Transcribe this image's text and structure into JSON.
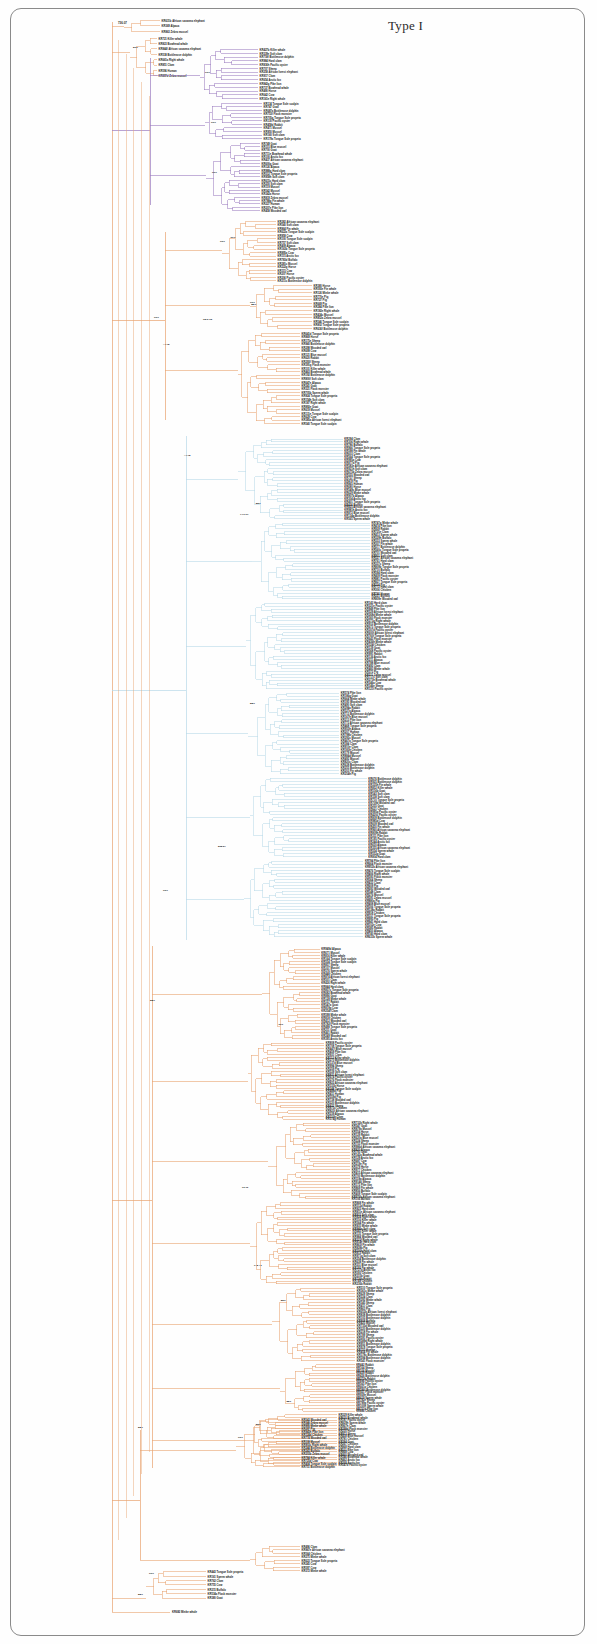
{
  "figure": {
    "title": "Type I",
    "type": "phylogenetic-tree",
    "frame_border_color": "#8a8a8a",
    "background": "#fefefe"
  },
  "clade_colors": {
    "purple": "#9b7cc0",
    "orange": "#e8a36f",
    "lightblue": "#b8d8e8",
    "label_text": "#1a1a1a"
  },
  "chart_data": {
    "type": "tree",
    "title": "Type I",
    "root_support": "736.07",
    "host_species": [
      "Cow",
      "Sheep",
      "Goat",
      "Pig",
      "Buffalo",
      "Horse",
      "Rabbit",
      "Human",
      "Chicken",
      "Pacific oyster",
      "Clam",
      "Mussel",
      "Zebra mussel",
      "Blue mussel",
      "Hard clam",
      "Soft clam",
      "Bottlenose dolphin",
      "Killer whale",
      "Sperm whale",
      "Minke whale",
      "Bowhead whale",
      "Fin whale",
      "Right whale",
      "African savanna elephant",
      "African forest elephant",
      "Tongue Sole scalpin",
      "Tongue Sole propeta",
      "Wooded owl",
      "Pike lion",
      "Flask monster",
      "Bottlenose dolphin",
      "Arctic fox",
      "Alpaca"
    ],
    "accession_prefix": "KR",
    "leaf_count": 484,
    "clades": [
      {
        "name": "Clade A (purple)",
        "color": "#9b7cc0",
        "span_y": [
          16,
          215
        ],
        "leaf_count": 52,
        "support_values": [
          "88/1",
          "99/1",
          "88/1",
          "99/1",
          "99/1",
          "99/1",
          "99/1"
        ]
      },
      {
        "name": "Clade B (orange upper)",
        "color": "#e8a36f",
        "span_y": [
          218,
          430
        ],
        "leaf_count": 58,
        "support_values": [
          "96/1",
          "98.6/.95",
          "99/1",
          "99/1",
          "99/1",
          "99/1"
        ]
      },
      {
        "name": "Clade C (light blue)",
        "color": "#b8d8e8",
        "span_y": [
          432,
          940
        ],
        "leaf_count": 168,
        "support_values": [
          "88/1",
          "74/1.01",
          "89/1",
          "96/1",
          "80/.9",
          "99/1",
          "909.27",
          "92/1",
          "98.4/.8",
          "82/1",
          "96.22"
        ]
      },
      {
        "name": "Clade D (orange lower)",
        "color": "#e8a36f",
        "span_y": [
          942,
          1470
        ],
        "leaf_count": 186,
        "support_values": [
          "97/1",
          "99/1",
          "98/1",
          "99/1",
          "98.4/.95",
          "948.43",
          "99/1",
          "88/1",
          "96.9/.85",
          "99/1"
        ]
      },
      {
        "name": "Clade E (basal orange)",
        "color": "#e8a36f",
        "span_y": [
          1470,
          1620
        ],
        "leaf_count": 20,
        "support_values": [
          "99/1",
          "88/1",
          "99/1"
        ]
      }
    ],
    "backbone_support_labels": [
      {
        "text": "736.07",
        "x": 121,
        "y": 23
      },
      {
        "text": "89/1",
        "x": 134,
        "y": 109
      },
      {
        "text": "99/1",
        "x": 209,
        "y": 105
      },
      {
        "text": "99/1",
        "x": 214,
        "y": 147
      },
      {
        "text": "99/1",
        "x": 214,
        "y": 174
      },
      {
        "text": "96/1",
        "x": 222,
        "y": 242
      },
      {
        "text": "98.6/.95",
        "x": 205,
        "y": 320
      },
      {
        "text": "99/1",
        "x": 134,
        "y": 306
      },
      {
        "text": "=4.78",
        "x": 167,
        "y": 347
      },
      {
        "text": "=4.78",
        "x": 186,
        "y": 458
      },
      {
        "text": "74/1.01",
        "x": 244,
        "y": 517
      },
      {
        "text": "88/1",
        "x": 252,
        "y": 706
      },
      {
        "text": "808.27",
        "x": 222,
        "y": 849
      },
      {
        "text": "96/1",
        "x": 163,
        "y": 893
      },
      {
        "text": "88/1",
        "x": 152,
        "y": 1003
      },
      {
        "text": "90.13",
        "x": 246,
        "y": 1190
      },
      {
        "text": "948.43",
        "x": 258,
        "y": 1268
      },
      {
        "text": "88/1",
        "x": 142,
        "y": 1430
      },
      {
        "text": "99/1",
        "x": 240,
        "y": 1440
      },
      {
        "text": "99/1",
        "x": 152,
        "y": 1576
      },
      {
        "text": "88/1",
        "x": 141,
        "y": 1596
      }
    ]
  }
}
